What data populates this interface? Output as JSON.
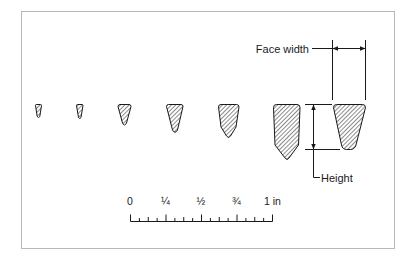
{
  "figure": {
    "belt_count": 7,
    "reference_belt_index": 6
  },
  "annotations": {
    "face_width_label": "Face width",
    "height_label": "Height"
  },
  "scale": {
    "labels": [
      "0",
      "¼",
      "½",
      "¾",
      "1 in"
    ],
    "major_divisions": 4,
    "minor_divisions_per_inch": 16,
    "unit": "in"
  },
  "colors": {
    "frame": "#b8b8b8",
    "ink": "#1a1a1a",
    "hatch": "#2a2a2a",
    "background": "#ffffff"
  }
}
